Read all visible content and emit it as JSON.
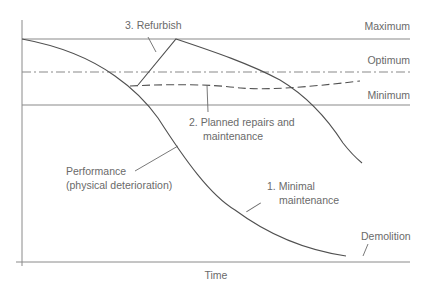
{
  "diagram": {
    "axis_label_x": "Time",
    "levels": {
      "maximum": "Maximum",
      "optimum": "Optimum",
      "minimum": "Minimum"
    },
    "annotations": {
      "refurbish": "3. Refurbish",
      "planned_line1": "2. Planned repairs and",
      "planned_line2": "maintenance",
      "performance_line1": "Performance",
      "performance_line2": "(physical deterioration)",
      "minimal_line1": "1. Minimal",
      "minimal_line2": "maintenance",
      "demolition": "Demolition"
    },
    "colors": {
      "curve": "#505050",
      "reference_lines": "#8a8a8a",
      "text": "#6a6a6a"
    }
  }
}
